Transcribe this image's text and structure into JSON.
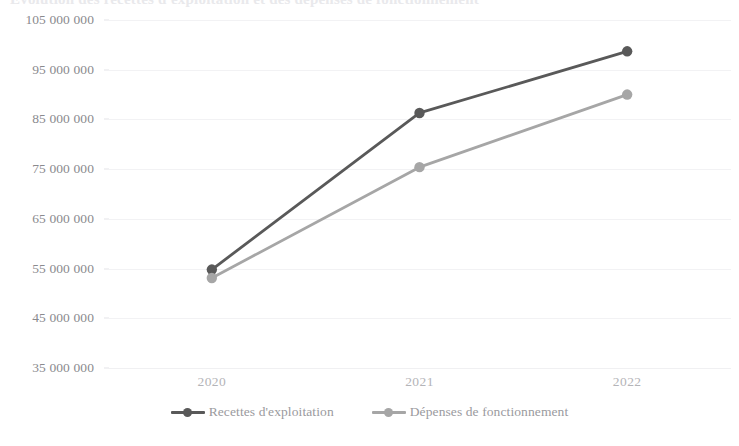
{
  "title_strip": {
    "text": "Evolution des recettes d'exploitation et des dépenses de fonctionnement"
  },
  "colors": {
    "series_1": "#595959",
    "series_2": "#a6a6a6",
    "gridline": "#f2f2f4",
    "tick_label": "#8a8a8e",
    "x_tick_label": "#b4b4b8",
    "legend_label": "#9a9a9e",
    "background": "#ffffff"
  },
  "chart_data": {
    "type": "line",
    "title": "",
    "xlabel": "",
    "ylabel": "",
    "categories": [
      "2020",
      "2021",
      "2022"
    ],
    "ylim": [
      35000000,
      105000000
    ],
    "ytick_step": 10000000,
    "ytick_labels": [
      "105 000 000",
      "95 000 000",
      "85 000 000",
      "75 000 000",
      "65 000 000",
      "55 000 000",
      "45 000 000",
      "35 000 000"
    ],
    "ytick_values": [
      105000000,
      95000000,
      85000000,
      75000000,
      65000000,
      55000000,
      45000000,
      35000000
    ],
    "grid": true,
    "legend_position": "bottom",
    "markers": true,
    "series": [
      {
        "name": "Recettes d'exploitation",
        "color": "#595959",
        "values": [
          54800000,
          86300000,
          98700000
        ]
      },
      {
        "name": "Dépenses de fonctionnement",
        "color": "#a6a6a6",
        "values": [
          53100000,
          75400000,
          90000000
        ]
      }
    ]
  },
  "legend": {
    "entries": [
      {
        "label": "Recettes d'exploitation"
      },
      {
        "label": "Dépenses de fonctionnement"
      }
    ]
  }
}
